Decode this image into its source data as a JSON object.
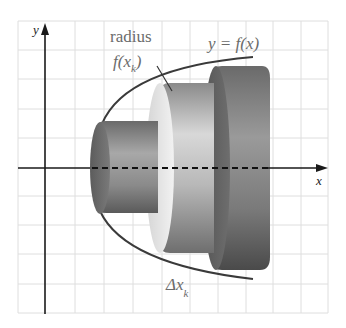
{
  "diagram": {
    "type": "solid-of-revolution-disk-method",
    "axes": {
      "x_label": "x",
      "y_label": "y"
    },
    "labels": {
      "curve": "y = f(x)",
      "radius_word": "radius",
      "radius_expr_f": "f(x",
      "radius_expr_sub": "k",
      "radius_expr_close": ")",
      "delta": "Δx",
      "delta_sub": "k"
    },
    "disks": [
      {
        "name": "small-disk",
        "relative_radius": "small"
      },
      {
        "name": "medium-disk",
        "relative_radius": "medium"
      },
      {
        "name": "large-disk",
        "relative_radius": "large"
      }
    ],
    "colors": {
      "grid": "#dcdcdc",
      "axis": "#1a1a1a",
      "curve": "#3a3a3a",
      "disk_dark": "#4a4a4a",
      "disk_light": "#e8e8e8",
      "label": "#6b6b6b"
    }
  }
}
